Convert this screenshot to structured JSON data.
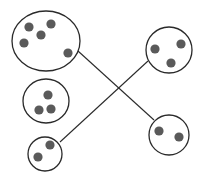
{
  "diagram": {
    "type": "set-matching",
    "background": "#ffffff",
    "stroke_color": "#2a2a2a",
    "dot_color": "#5a5a5a",
    "groups": [
      {
        "id": "left-top",
        "count": 5,
        "cx": 46,
        "cy": 41,
        "rx": 34,
        "ry": 30,
        "dots": [
          [
            29,
            27
          ],
          [
            51,
            24
          ],
          [
            41,
            35
          ],
          [
            24,
            43
          ],
          [
            68,
            53
          ]
        ]
      },
      {
        "id": "left-middle",
        "count": 3,
        "cx": 46,
        "cy": 101,
        "rx": 23,
        "ry": 22,
        "dots": [
          [
            48,
            95
          ],
          [
            39,
            110
          ],
          [
            51,
            109
          ]
        ]
      },
      {
        "id": "left-bottom",
        "count": 2,
        "cx": 45,
        "cy": 154,
        "rx": 17,
        "ry": 17,
        "dots": [
          [
            50,
            145
          ],
          [
            38,
            157
          ]
        ]
      },
      {
        "id": "right-top",
        "count": 3,
        "cx": 169,
        "cy": 50,
        "rx": 23,
        "ry": 23,
        "dots": [
          [
            155,
            49
          ],
          [
            181,
            44
          ],
          [
            171,
            63
          ]
        ]
      },
      {
        "id": "right-bottom",
        "count": 2,
        "cx": 169,
        "cy": 135,
        "rx": 20,
        "ry": 20,
        "dots": [
          [
            159,
            131
          ],
          [
            179,
            137
          ]
        ]
      }
    ],
    "connections": [
      {
        "from": "left-top",
        "to": "right-bottom",
        "x1": 78,
        "y1": 51,
        "x2": 154,
        "y2": 120
      },
      {
        "from": "left-bottom",
        "to": "right-top",
        "x1": 60,
        "y1": 142,
        "x2": 148,
        "y2": 61
      }
    ]
  }
}
